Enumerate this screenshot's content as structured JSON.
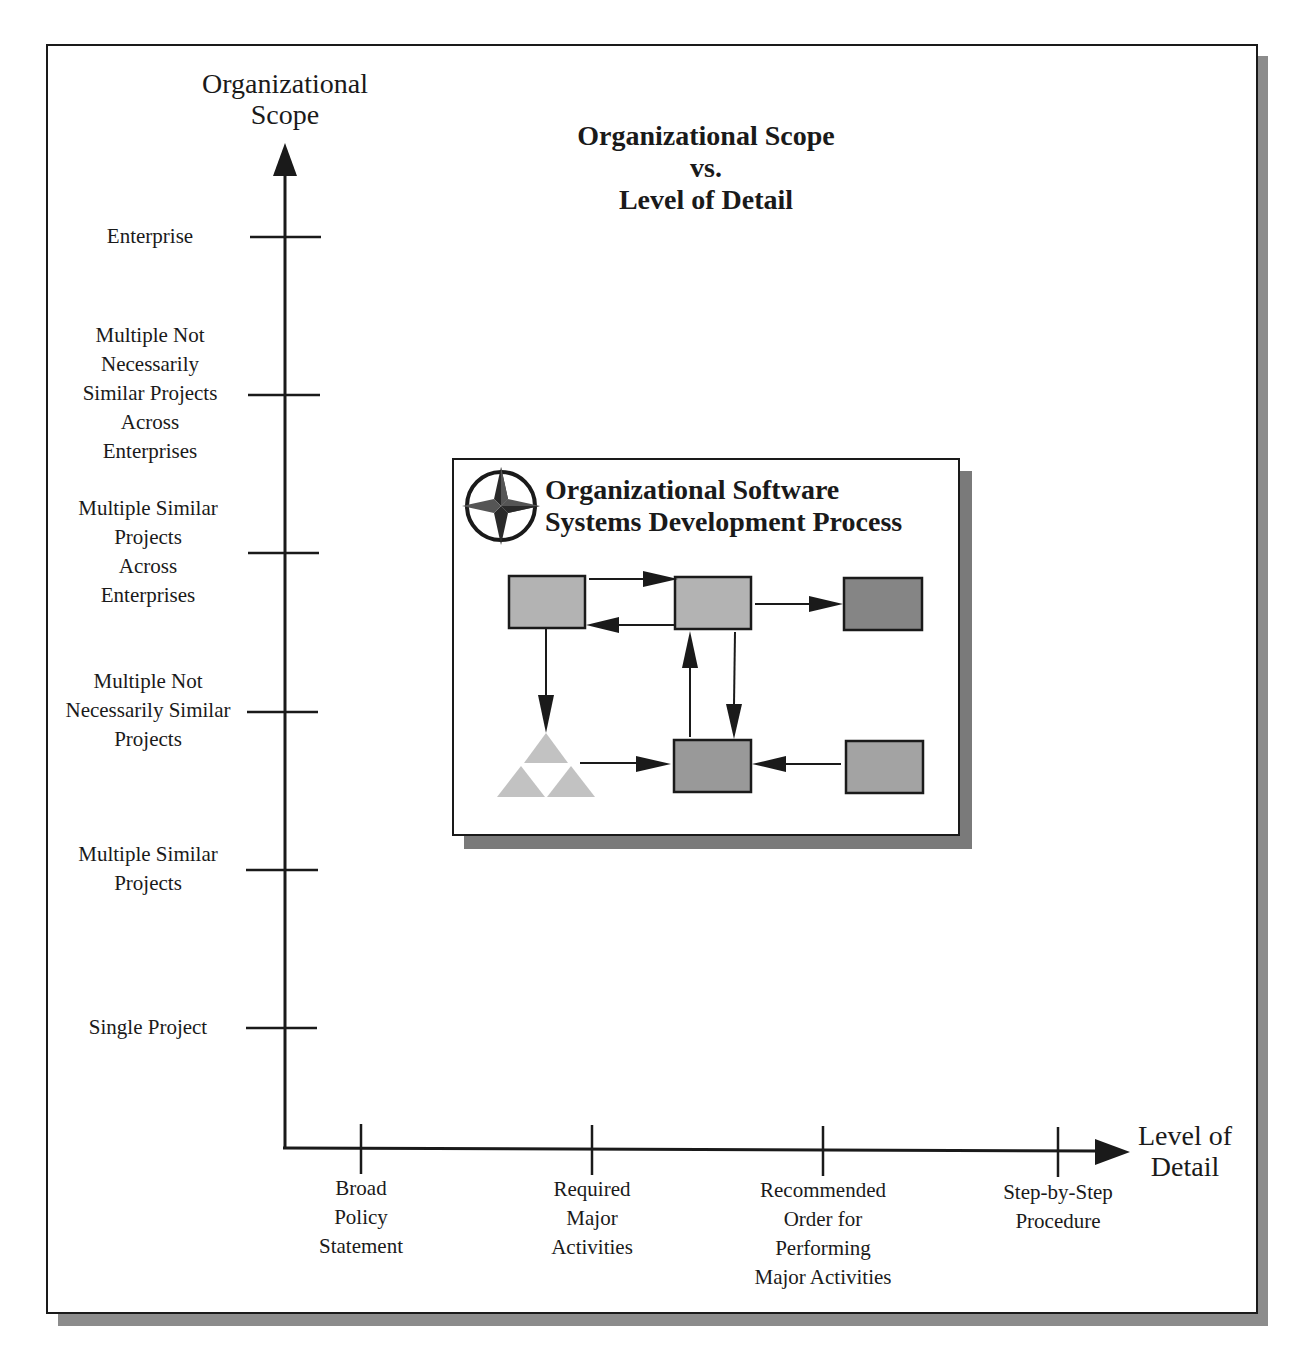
{
  "figure": {
    "title": "Organizational Scope\nvs.\nLevel of Detail",
    "y_axis_title": "Organizational\nScope",
    "x_axis_title": "Level of\nDetail"
  },
  "y_axis": {
    "ticks": [
      {
        "label": "Enterprise",
        "y": 237
      },
      {
        "label": "Multiple Not\nNecessarily\nSimilar Projects\nAcross\nEnterprises",
        "y": 395
      },
      {
        "label": "Multiple  Similar\nProjects\nAcross\nEnterprises",
        "y": 553
      },
      {
        "label": "Multiple Not\nNecessarily Similar\nProjects",
        "y": 712
      },
      {
        "label": "Multiple Similar\nProjects",
        "y": 870
      },
      {
        "label": "Single Project",
        "y": 1028
      }
    ]
  },
  "x_axis": {
    "ticks": [
      {
        "label": "Broad\nPolicy\nStatement",
        "x": 361
      },
      {
        "label": "Required\nMajor\nActivities",
        "x": 592
      },
      {
        "label": "Recommended\nOrder for\nPerforming\nMajor Activities",
        "x": 823
      },
      {
        "label": "Step-by-Step\nProcedure",
        "x": 1058
      }
    ]
  },
  "inset": {
    "title": "Organizational Software\nSystems Development Process",
    "icon": "compass-star-icon",
    "colors": {
      "light_box": "#b3b3b3",
      "medium_box": "#999999",
      "dark_box": "#858585",
      "triangle": "#c2c2c2"
    }
  }
}
